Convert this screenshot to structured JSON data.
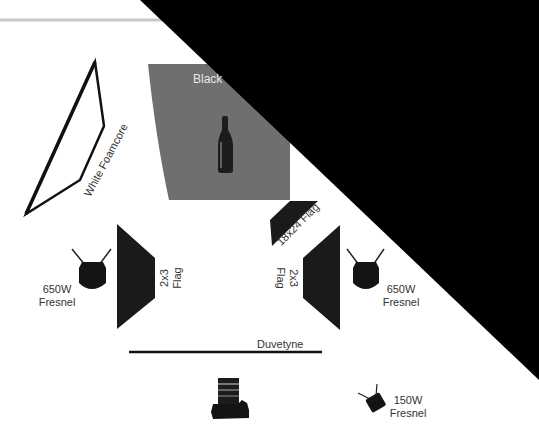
{
  "diagram": {
    "colors": {
      "background": "#ffffff",
      "backdrop": "#6f6f6f",
      "flag": "#1a1a1a",
      "lamp": "#141414",
      "top_rule": "#c8c8c8",
      "overlay": "#000000",
      "label": "#333333"
    },
    "backdrop": {
      "label": "Black"
    },
    "subject": {
      "name": "Wine bottle"
    },
    "reflector": {
      "label": "White Foamcore"
    },
    "flags": {
      "left": {
        "line1": "2x3",
        "line2": "Flag"
      },
      "right": {
        "line1": "2x3",
        "line2": "Flag"
      },
      "top": {
        "label": "18x24 Flag"
      }
    },
    "lights": {
      "left": {
        "line1": "650W",
        "line2": "Fresnel"
      },
      "right": {
        "line1": "650W",
        "line2": "Fresnel"
      },
      "small": {
        "line1": "150W",
        "line2": "Fresnel"
      }
    },
    "duvetyne": {
      "label": "Duvetyne"
    },
    "camera": {
      "name": "Camera"
    }
  }
}
